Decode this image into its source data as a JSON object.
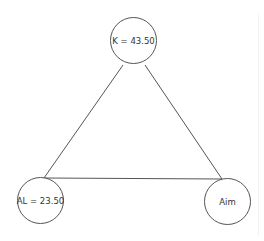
{
  "diagram": {
    "type": "graph",
    "colors": {
      "background": "#ffffff",
      "stroke": "#555555",
      "text": "#333333"
    },
    "nodes": [
      {
        "id": "K",
        "label": "K = 43.50",
        "cx": 134,
        "cy": 41,
        "r": 24
      },
      {
        "id": "AL",
        "label": "AL = 23.50",
        "cx": 41,
        "cy": 201,
        "r": 24
      },
      {
        "id": "Aim",
        "label": "Aim",
        "cx": 228,
        "cy": 202,
        "r": 24
      }
    ],
    "edges": [
      {
        "from": "K",
        "to": "AL",
        "x1": 123,
        "y1": 65,
        "x2": 44,
        "y2": 178
      },
      {
        "from": "K",
        "to": "Aim",
        "x1": 145,
        "y1": 65,
        "x2": 222,
        "y2": 179
      },
      {
        "from": "AL",
        "to": "Aim",
        "x1": 44,
        "y1": 178,
        "x2": 222,
        "y2": 179
      }
    ]
  }
}
